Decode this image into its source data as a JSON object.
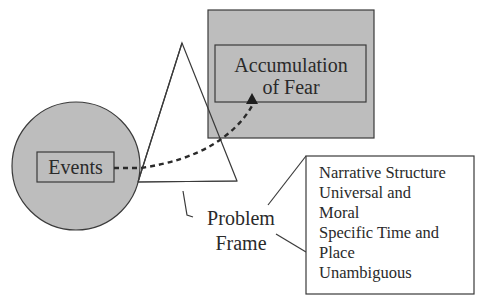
{
  "diagram": {
    "colors": {
      "fill_gray": "#bdbdbd",
      "stroke": "#3a3a3a",
      "background": "#ffffff",
      "text": "#2a2a2a"
    },
    "nodes": {
      "events": {
        "label": "Events",
        "shape": "circle"
      },
      "accumulation": {
        "label_line1": "Accumulation",
        "label_line2": "of Fear",
        "shape": "rectangle"
      },
      "problem_frame": {
        "label_line1": "Problem",
        "label_line2": "Frame",
        "shape": "triangle"
      },
      "attributes": {
        "lines": [
          "Narrative Structure",
          "Universal and",
          "Moral",
          "Specific Time and",
          "Place",
          "Unambiguous"
        ]
      }
    },
    "edges": [
      {
        "from": "events",
        "to": "accumulation",
        "style": "dashed-arrow"
      },
      {
        "from": "problem_frame",
        "to": "attributes",
        "style": "callout"
      }
    ]
  }
}
